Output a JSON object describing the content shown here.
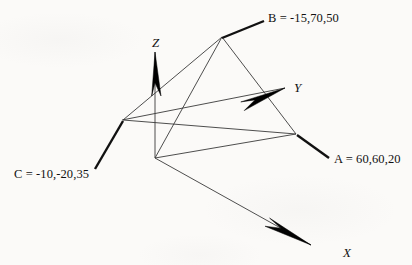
{
  "figure": {
    "background_color": "#fbfaf8",
    "line_color": "#3a3a3a",
    "arrow_color": "#000000",
    "text_color": "#111111",
    "axes": [
      {
        "name": "X",
        "label": "X",
        "label_x": 343,
        "label_y": 246,
        "line": {
          "x1": 155,
          "y1": 158,
          "x2": 311,
          "y2": 245
        },
        "arrow": {
          "tip_x": 311,
          "tip_y": 245,
          "base_x": 268,
          "base_y": 221,
          "half_width": 6
        }
      },
      {
        "name": "Y",
        "label": "Y",
        "label_x": 294,
        "label_y": 81,
        "line": {
          "x1": 122,
          "y1": 120,
          "x2": 285,
          "y2": 88
        },
        "arrow": {
          "tip_x": 285,
          "tip_y": 88,
          "base_x": 242,
          "base_y": 105,
          "half_width": 6
        }
      },
      {
        "name": "Z",
        "label": "Z",
        "label_x": 152,
        "label_y": 36,
        "line": {
          "x1": 155,
          "y1": 158,
          "x2": 155,
          "y2": 52
        },
        "arrow": {
          "tip_x": 155,
          "tip_y": 52,
          "base_x": 155,
          "base_y": 96,
          "half_width": 6
        }
      }
    ],
    "triangle": {
      "name": "triangle-abc",
      "vertices": [
        {
          "id": "C",
          "x": 123,
          "y": 120
        },
        {
          "id": "B",
          "x": 222,
          "y": 37
        },
        {
          "id": "A",
          "x": 296,
          "y": 134
        }
      ]
    },
    "projection_lines": [
      {
        "name": "b-drop-line",
        "x1": 222,
        "y1": 37,
        "x2": 155,
        "y2": 158
      },
      {
        "name": "origin-to-a-line",
        "x1": 155,
        "y1": 158,
        "x2": 296,
        "y2": 134
      }
    ],
    "points": [
      {
        "id": "A",
        "label": "A = 60,60,20",
        "x": 60,
        "y": 60,
        "z": 20,
        "label_x": 334,
        "label_y": 153,
        "leader": {
          "x1": 297,
          "y1": 135,
          "x2": 329,
          "y2": 158
        }
      },
      {
        "id": "B",
        "label": "B = -15,70,50",
        "x": -15,
        "y": 70,
        "z": 50,
        "label_x": 268,
        "label_y": 12,
        "leader": {
          "x1": 222,
          "y1": 38,
          "x2": 264,
          "y2": 21
        }
      },
      {
        "id": "C",
        "label": "C = -10,-20,35",
        "x": -10,
        "y": -20,
        "z": 35,
        "label_x": 14,
        "label_y": 168,
        "leader": {
          "x1": 123,
          "y1": 121,
          "x2": 95,
          "y2": 169
        }
      }
    ]
  }
}
